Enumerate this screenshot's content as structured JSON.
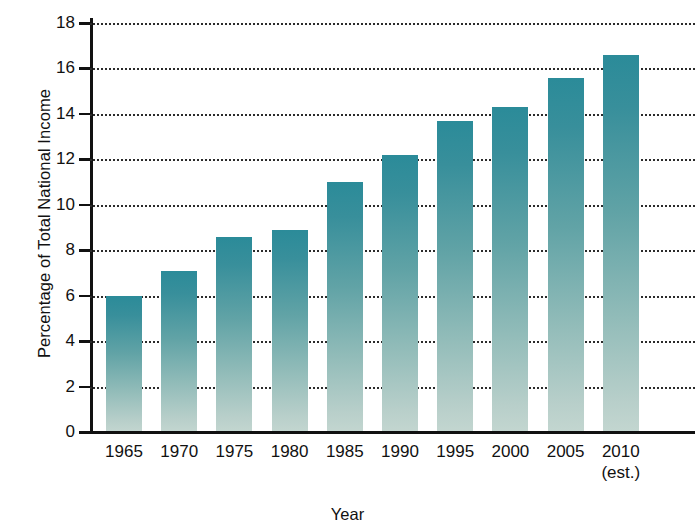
{
  "chart_data": {
    "type": "bar",
    "title": "",
    "xlabel": "Year",
    "ylabel": "Percentage of Total National Income",
    "categories": [
      "1965",
      "1970",
      "1975",
      "1980",
      "1985",
      "1990",
      "1995",
      "2000",
      "2005",
      "2010"
    ],
    "category_sublabels": [
      "",
      "",
      "",
      "",
      "",
      "",
      "",
      "",
      "",
      "(est.)"
    ],
    "values": [
      6.0,
      7.1,
      8.6,
      8.9,
      11.0,
      12.2,
      13.7,
      14.3,
      15.6,
      16.6
    ],
    "ylim": [
      0,
      18
    ],
    "ytick_labels": [
      "18",
      "16",
      "14",
      "12",
      "10",
      "8",
      "6",
      "4",
      "2",
      "0"
    ],
    "ytick_values": [
      18,
      16,
      14,
      12,
      10,
      8,
      6,
      4,
      2,
      0
    ],
    "grid": "horizontal-dotted",
    "legend": "none",
    "bar_color_top": "#2b8b99",
    "bar_color_bottom": "#c3d6d0",
    "axis_color": "#111111",
    "grid_color": "#2b2b2b",
    "background": "#ffffff"
  }
}
